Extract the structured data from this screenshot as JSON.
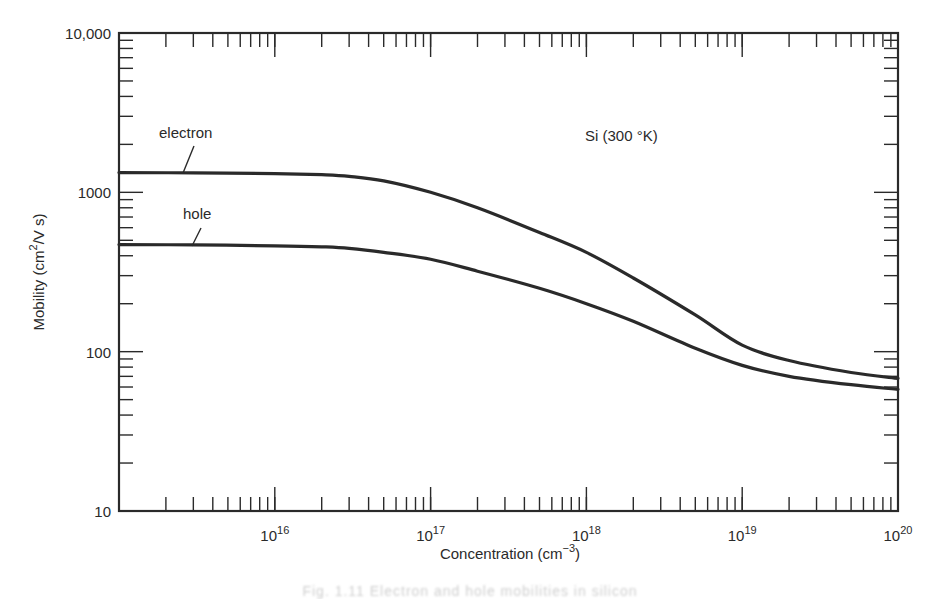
{
  "chart_data": {
    "type": "line",
    "title": "",
    "annotation": "Si (300 °K)",
    "xlabel": "Concentration (cm⁻³)",
    "ylabel": "Mobility (cm²/V s)",
    "xscale": "log",
    "yscale": "log",
    "xlim": [
      1000000000000000.0,
      1e+20
    ],
    "ylim": [
      10,
      10000
    ],
    "x_tick_labels": [
      {
        "value": 1e+16,
        "base": "10",
        "exp": "16"
      },
      {
        "value": 1e+17,
        "base": "10",
        "exp": "17"
      },
      {
        "value": 1e+18,
        "base": "10",
        "exp": "18"
      },
      {
        "value": 1e+19,
        "base": "10",
        "exp": "19"
      },
      {
        "value": 1e+20,
        "base": "10",
        "exp": "20"
      }
    ],
    "y_tick_labels": [
      {
        "value": 10,
        "label": "10"
      },
      {
        "value": 100,
        "label": "100"
      },
      {
        "value": 1000,
        "label": "1000"
      },
      {
        "value": 10000,
        "label": "10,000"
      }
    ],
    "grid": false,
    "legend": "inline labels",
    "x": [
      1000000000000000.0,
      3000000000000000.0,
      1e+16,
      2e+16,
      3e+16,
      5e+16,
      1e+17,
      2e+17,
      5e+17,
      1e+18,
      2e+18,
      5e+18,
      1e+19,
      2e+19,
      5e+19,
      1e+20
    ],
    "series": [
      {
        "name": "electron",
        "label": "electron",
        "values": [
          1330,
          1325,
          1310,
          1290,
          1260,
          1180,
          1000,
          800,
          560,
          420,
          290,
          170,
          110,
          88,
          74,
          68
        ]
      },
      {
        "name": "hole",
        "label": "hole",
        "values": [
          470,
          468,
          462,
          455,
          445,
          420,
          380,
          320,
          250,
          200,
          155,
          105,
          82,
          70,
          62,
          58
        ]
      }
    ]
  },
  "labels": {
    "electron": "electron",
    "hole": "hole",
    "material": "Si (300 °K)",
    "xlabel_main": "Concentration (cm",
    "xlabel_exp": "−3",
    "xlabel_close": ")",
    "ylabel_main": "Mobility (cm",
    "ylabel_exp": "2",
    "ylabel_rest": "/V s)"
  },
  "caption": "Fig. 1.11 Electron and hole mobilities in silicon"
}
